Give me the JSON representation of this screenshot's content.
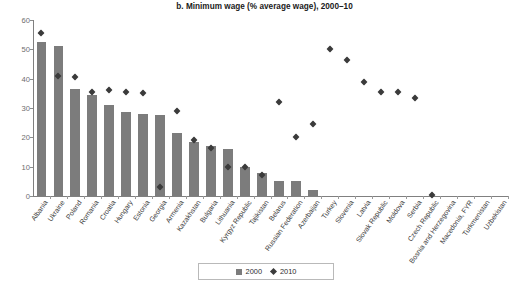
{
  "chart_data": {
    "type": "bar",
    "title": "b. Minimum wage (% average wage), 2000–10",
    "xlabel": "",
    "ylabel": "",
    "ylim": [
      0,
      60
    ],
    "yticks": [
      0,
      10,
      20,
      30,
      40,
      50,
      60
    ],
    "grid": false,
    "legend_position": "bottom-center",
    "categories": [
      "Albania",
      "Ukraine",
      "Poland",
      "Romania",
      "Croatia",
      "Hungary",
      "Estonia",
      "Georgia",
      "Armenia",
      "Kazakhstan",
      "Bulgaria",
      "Lithuania",
      "Kyrgyz Republic",
      "Tajikistan",
      "Belarus",
      "Russian Federation",
      "Azerbaijan",
      "Turkey",
      "Slovenia",
      "Latvia",
      "Slovak Republic",
      "Moldova",
      "Serbia",
      "Czech Republic",
      "Bosnia and Herzegovina",
      "Macedonia, FYR",
      "Turkmenistan",
      "Uzbekistan"
    ],
    "series": [
      {
        "name": "2000",
        "marker": "square",
        "color": "#7c7c7c",
        "values": [
          52.5,
          51,
          36.5,
          34.5,
          31,
          28.5,
          28,
          27.5,
          21.5,
          18.5,
          17,
          16,
          10,
          8,
          5,
          5,
          2,
          null,
          null,
          null,
          null,
          null,
          null,
          null,
          null,
          null,
          null,
          null
        ]
      },
      {
        "name": "2010",
        "marker": "diamond",
        "color": "#3b3b3b",
        "values": [
          55.5,
          41,
          40.5,
          35.5,
          36,
          35.5,
          35,
          3,
          29,
          19,
          16.5,
          10,
          10,
          7,
          32,
          20,
          24.5,
          50,
          46.5,
          39,
          35.5,
          35.5,
          33.5,
          0.5,
          null,
          null,
          null,
          null
        ]
      }
    ]
  },
  "legend": {
    "items": [
      {
        "label": "2000",
        "marker": "square"
      },
      {
        "label": "2010",
        "marker": "diamond"
      }
    ]
  }
}
